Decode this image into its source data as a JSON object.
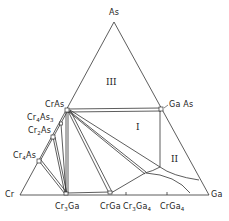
{
  "diagram": {
    "type": "ternary-phase-diagram",
    "vertices": {
      "top": "As",
      "left": "Cr",
      "right": "Ga"
    },
    "phases": {
      "CrAs": "CrAs",
      "Cr4As3": {
        "base": "Cr",
        "sub1": "4",
        "mid": "As",
        "sub2": "3"
      },
      "Cr2As": {
        "base": "Cr",
        "sub1": "2",
        "mid": "As"
      },
      "Cr4As": {
        "base": "Cr",
        "sub1": "4",
        "mid": "As"
      },
      "GaAs": "Ga As",
      "Cr3Ga": {
        "base": "Cr",
        "sub1": "3",
        "mid": "Ga"
      },
      "CrGa": "CrGa",
      "Cr3Ga4": {
        "base": "Cr",
        "sub1": "3",
        "mid": "Ga",
        "sub2": "4"
      },
      "CrGa4": {
        "base": "CrGa",
        "sub2": "4"
      }
    },
    "regions": {
      "I": "I",
      "II": "II",
      "III": "III"
    },
    "colors": {
      "line": "#333333",
      "background": "#ffffff"
    }
  }
}
